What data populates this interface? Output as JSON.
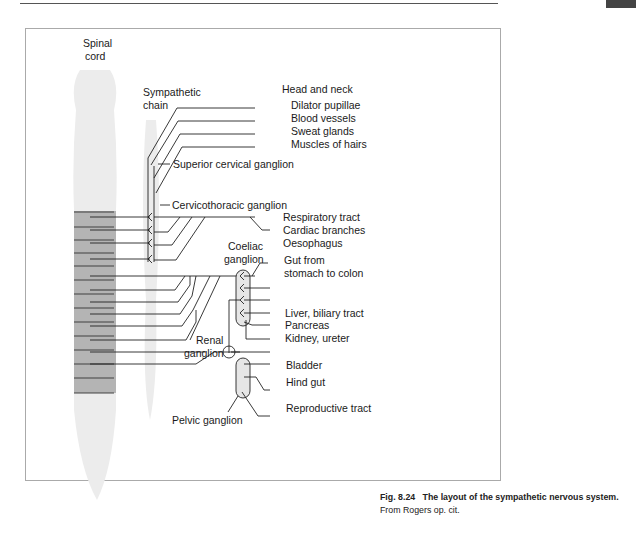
{
  "header": {
    "running_text": ""
  },
  "diagram": {
    "labels": {
      "spinal_cord": [
        "Spinal",
        "cord"
      ],
      "sympathetic_chain": [
        "Sympathetic",
        "chain"
      ],
      "head_and_neck": "Head and neck",
      "superior_cervical_ganglion": "Superior cervical ganglion",
      "cervicothoracic_ganglion": "Cervicothoracic ganglion",
      "coeliac_ganglion": [
        "Coeliac",
        "ganglion"
      ],
      "renal_ganglion": [
        "Renal",
        "ganglion"
      ],
      "pelvic_ganglion": "Pelvic ganglion"
    },
    "targets": [
      "Dilator pupillae",
      "Blood vessels",
      "Sweat glands",
      "Muscles of hairs",
      "Respiratory tract",
      "Cardiac branches",
      "Oesophagus",
      "Gut from",
      "stomach to colon",
      "Liver, biliary tract",
      "Pancreas",
      "Kidney, ureter",
      "Bladder",
      "Hind gut",
      "Reproductive tract"
    ]
  },
  "caption": {
    "figure_number": "Fig. 8.24",
    "title": "The layout of the sympathetic nervous system.",
    "source": "From Rogers op. cit."
  }
}
